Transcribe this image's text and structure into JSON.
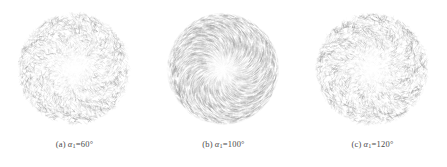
{
  "figure": {
    "background_color": "#ffffff",
    "panel_count": 3,
    "stroke_color": "#8c8c8c"
  },
  "panels": [
    {
      "tag": "(a)",
      "variable": "α",
      "subscript": "1",
      "equals": "=",
      "value": "60",
      "unit": "°",
      "caption_full": "(a) α1 =60°"
    },
    {
      "tag": "(b)",
      "variable": "α",
      "subscript": "1",
      "equals": "=",
      "value": "100",
      "unit": "°",
      "caption_full": "(b) α1 =100°"
    },
    {
      "tag": "(c)",
      "variable": "α",
      "subscript": "1",
      "equals": "=",
      "value": "120",
      "unit": "°",
      "caption_full": "(c) α1 =120°"
    }
  ],
  "chart_data": {
    "type": "scatter",
    "title": "",
    "xlabel": "",
    "ylabel": "",
    "plot_style": "vector-field-quiver-on-circular-domain",
    "panels": [
      {
        "name": "a",
        "label": "(a) α1 =60°",
        "alpha1_deg": 60,
        "domain": "circular disc",
        "center_px": [
          74,
          69
        ],
        "radius_px": 56,
        "pattern": "incoherent swirling vectors, sparse and noisy",
        "coherence": 0.25,
        "vector_count": 3200,
        "mean_opacity": 0.33,
        "swirl_turns": 1.6,
        "jitter": 0.85
      },
      {
        "name": "b",
        "label": "(b) α1 =100°",
        "alpha1_deg": 100,
        "domain": "circular disc",
        "center_px": [
          74,
          69
        ],
        "radius_px": 56,
        "pattern": "coherent dense spiral vortex, regular parallel strokes",
        "coherence": 0.95,
        "vector_count": 5200,
        "mean_opacity": 0.42,
        "swirl_turns": 1.1,
        "jitter": 0.06
      },
      {
        "name": "c",
        "label": "(c) α1 =120°",
        "alpha1_deg": 120,
        "domain": "circular disc",
        "center_px": [
          74,
          69
        ],
        "radius_px": 56,
        "pattern": "incoherent swirling vectors, sparse and noisy",
        "coherence": 0.3,
        "vector_count": 3300,
        "mean_opacity": 0.35,
        "swirl_turns": 1.5,
        "jitter": 0.8
      }
    ],
    "legend": [],
    "grid": false
  }
}
